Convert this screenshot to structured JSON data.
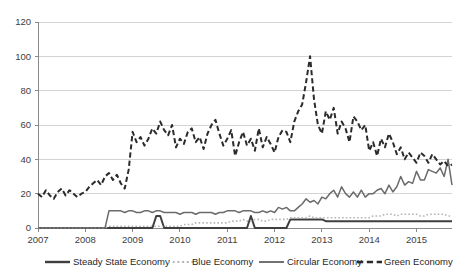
{
  "chart_data": {
    "type": "line",
    "title": "",
    "subtitle": "",
    "xlabel": "",
    "ylabel": "",
    "ylim": [
      0,
      120
    ],
    "yticks": [
      0,
      20,
      40,
      60,
      80,
      100,
      120
    ],
    "ytick_labels": [
      "0",
      "20",
      "40",
      "60",
      "80",
      "100",
      "120"
    ],
    "xtick_labels": [
      "2007",
      "2008",
      "2009",
      "2010",
      "2011",
      "2012",
      "2013",
      "2014",
      "2015"
    ],
    "x_start_year": 2007,
    "x_points_per_year": 12,
    "x_note": "monthly index, Jan 2007 through approx Oct 2015",
    "grid": "horizontal",
    "legend_position": "bottom",
    "series": [
      {
        "name": "Steady State Economy",
        "style": "solid",
        "color": "#3f3f3f",
        "width": 2.0,
        "values": [
          0,
          0,
          0,
          0,
          0,
          0,
          0,
          0,
          0,
          0,
          0,
          0,
          0,
          0,
          0,
          0,
          0,
          0,
          0,
          0,
          0,
          0,
          0,
          0,
          0,
          0,
          0,
          0,
          0,
          0,
          7,
          7,
          0,
          0,
          0,
          0,
          0,
          0,
          0,
          0,
          0,
          0,
          0,
          0,
          0,
          0,
          0,
          0,
          0,
          0,
          0,
          0,
          0,
          0,
          7,
          0,
          0,
          0,
          0,
          0,
          0,
          0,
          0,
          0,
          5,
          5,
          5,
          5,
          5,
          5,
          5,
          5,
          5,
          4,
          4,
          4,
          4,
          4,
          4,
          4,
          4,
          4,
          4,
          4,
          4,
          4,
          4,
          4,
          4,
          4,
          4,
          4,
          4,
          4,
          4,
          4,
          4,
          4,
          4,
          4,
          4,
          4,
          4,
          4,
          4,
          4
        ]
      },
      {
        "name": "Blue Economy",
        "style": "dotted",
        "color": "#b5b5b5",
        "width": 1.6,
        "values": [
          0,
          0,
          0,
          0,
          0,
          0,
          0,
          0,
          0,
          0,
          0,
          0,
          0,
          0,
          0,
          0,
          0,
          0,
          1,
          1,
          1,
          1,
          1,
          1,
          1,
          1,
          1,
          1,
          1,
          1,
          1,
          1,
          1,
          1,
          1,
          1,
          1,
          2,
          2,
          2,
          3,
          3,
          3,
          3,
          3,
          3,
          3,
          3,
          3,
          4,
          4,
          4,
          5,
          4,
          4,
          5,
          5,
          4,
          4,
          5,
          5,
          5,
          5,
          5,
          6,
          6,
          6,
          6,
          6,
          7,
          6,
          6,
          6,
          6,
          6,
          6,
          6,
          6,
          6,
          6,
          6,
          6,
          6,
          6,
          6,
          7,
          7,
          7,
          8,
          8,
          8,
          7,
          8,
          8,
          8,
          8,
          8,
          7,
          7,
          8,
          8,
          8,
          8,
          8,
          7,
          7
        ]
      },
      {
        "name": "Circular Economy",
        "style": "solid",
        "color": "#6b6b6b",
        "width": 1.5,
        "values": [
          0,
          0,
          0,
          0,
          0,
          0,
          0,
          0,
          0,
          0,
          0,
          0,
          0,
          0,
          0,
          0,
          0,
          0,
          10,
          10,
          10,
          10,
          9,
          10,
          10,
          9,
          9,
          10,
          10,
          9,
          10,
          10,
          9,
          9,
          9,
          9,
          8,
          9,
          9,
          9,
          8,
          9,
          9,
          9,
          9,
          8,
          9,
          9,
          10,
          10,
          10,
          9,
          10,
          10,
          10,
          9,
          9,
          10,
          9,
          10,
          9,
          12,
          11,
          12,
          10,
          10,
          12,
          14,
          17,
          15,
          16,
          14,
          18,
          17,
          20,
          22,
          18,
          24,
          20,
          18,
          21,
          18,
          22,
          18,
          20,
          20,
          22,
          23,
          20,
          25,
          21,
          24,
          30,
          25,
          27,
          26,
          33,
          28,
          28,
          34,
          33,
          32,
          35,
          30,
          40,
          25
        ]
      },
      {
        "name": "Green Economy",
        "style": "dashed",
        "color": "#2b2b2b",
        "width": 2.0,
        "values": [
          20,
          18,
          22,
          19,
          17,
          21,
          23,
          19,
          22,
          20,
          18,
          20,
          21,
          24,
          26,
          28,
          25,
          30,
          32,
          28,
          31,
          26,
          23,
          34,
          56,
          50,
          53,
          48,
          52,
          58,
          55,
          62,
          57,
          54,
          60,
          47,
          52,
          49,
          56,
          58,
          50,
          53,
          46,
          55,
          60,
          63,
          55,
          48,
          52,
          57,
          42,
          50,
          56,
          48,
          52,
          45,
          58,
          47,
          53,
          49,
          44,
          53,
          57,
          56,
          50,
          62,
          68,
          72,
          85,
          100,
          75,
          60,
          55,
          68,
          63,
          70,
          55,
          62,
          58,
          50,
          65,
          62,
          57,
          60,
          45,
          50,
          42,
          52,
          47,
          55,
          50,
          43,
          47,
          40,
          44,
          41,
          38,
          44,
          42,
          38,
          43,
          40,
          37,
          39,
          36,
          37
        ]
      }
    ]
  },
  "legend": {
    "items": [
      {
        "label": "Steady State Economy"
      },
      {
        "label": "Blue Economy"
      },
      {
        "label": "Circular Economy"
      },
      {
        "label": "Green Economy"
      }
    ]
  }
}
